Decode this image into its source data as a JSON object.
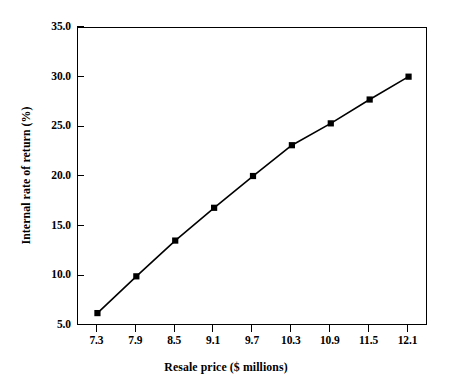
{
  "chart_data": {
    "type": "line",
    "title": "",
    "xlabel": "Resale price ($ millions)",
    "ylabel": "Internal rate of return (%)",
    "x": [
      7.3,
      7.9,
      8.5,
      9.1,
      9.7,
      10.3,
      10.9,
      11.5,
      12.1
    ],
    "values": [
      6.3,
      10.0,
      13.6,
      16.9,
      20.1,
      23.2,
      25.4,
      27.8,
      30.1
    ],
    "series": [
      {
        "name": "Internal rate of return",
        "values": [
          6.3,
          10.0,
          13.6,
          16.9,
          20.1,
          23.2,
          25.4,
          27.8,
          30.1
        ]
      }
    ],
    "xtick_labels": [
      "7.3",
      "7.9",
      "8.5",
      "9.1",
      "9.7",
      "10.3",
      "10.9",
      "11.5",
      "12.1"
    ],
    "ytick_labels": [
      "5.0",
      "10.0",
      "15.0",
      "20.0",
      "25.0",
      "30.0",
      "35.0"
    ],
    "yticks": [
      5.0,
      10.0,
      15.0,
      20.0,
      25.0,
      30.0,
      35.0
    ],
    "xlim": [
      7.0,
      12.4
    ],
    "ylim": [
      5.0,
      35.0
    ],
    "grid": false,
    "legend": false,
    "legend_position": "none",
    "marker": "square",
    "marker_color": "#000000",
    "line_color": "#000000",
    "background_color": "#ffffff",
    "axis_color": "#000000"
  }
}
